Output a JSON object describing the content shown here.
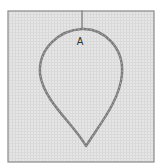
{
  "figure": {
    "type": "embroidery-stitch-diagram",
    "label": "A",
    "colors": {
      "background": "#ffffff",
      "fabric": "#e6e6e6",
      "fabric_weave": "#d4d4d4",
      "frame_border": "#8a8a8a",
      "thread": "#7a7a7a",
      "thread_highlight": "#a8a8a8",
      "label": "#333333"
    },
    "frame": {
      "x": 8,
      "y": 11,
      "width": 146,
      "height": 151
    },
    "stem": {
      "x1": 82,
      "y1": 11,
      "x2": 82,
      "y2": 29
    },
    "leaf_outline_path": "M82,29 C104,28 124,48 122,74 C120,100 100,124 86,146 C74,124 44,102 40,74 C38,48 60,30 82,29 Z",
    "label_position": {
      "x": 80,
      "y": 45
    }
  }
}
